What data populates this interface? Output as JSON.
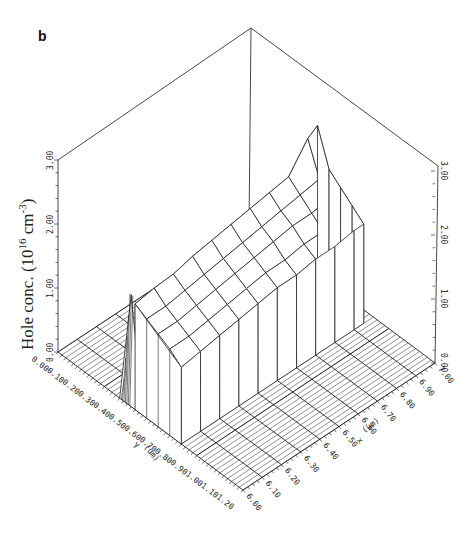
{
  "panel_label": "b",
  "chart_data": {
    "type": "surface3d",
    "title": "",
    "panel": "b",
    "zlabel": "Hole conc. (10^16 cm^-3)",
    "zlabel_parts": {
      "main": "Hole conc. (10",
      "sup1": "16",
      "mid": " cm",
      "sup2": "-3",
      "end": ")"
    },
    "xlabel": "x (um)",
    "ylabel": "y (um)",
    "x_ticks": [
      "6.00",
      "6.10",
      "6.20",
      "6.30",
      "6.40",
      "6.50",
      "6.60",
      "6.70",
      "6.80",
      "6.90",
      "7.00"
    ],
    "y_ticks": [
      "0.00",
      "0.10",
      "0.20",
      "0.30",
      "0.40",
      "0.50",
      "0.60",
      "0.70",
      "0.80",
      "0.90",
      "1.00",
      "1.10",
      "1.20"
    ],
    "z_ticks_left": [
      "0.00",
      "1.00",
      "2.00",
      "3.00"
    ],
    "z_ticks_right": [
      "0.00",
      "1.00",
      "2.00",
      "3.00"
    ],
    "xlim": [
      6.0,
      7.0
    ],
    "ylim": [
      0.0,
      1.2
    ],
    "zlim": [
      0.0,
      3.0
    ],
    "grid": false,
    "legend": null,
    "x": [
      6.0,
      6.1,
      6.2,
      6.3,
      6.4,
      6.5,
      6.6,
      6.7,
      6.8,
      6.9,
      6.95
    ],
    "y": [
      0.5,
      0.575,
      0.65,
      0.725,
      0.8
    ],
    "z_rows_note": "Hole concentration plateau between y=0.50 and y=0.80 um; zero elsewhere",
    "z": [
      [
        1.65,
        1.7,
        1.72,
        1.8,
        1.85,
        1.9,
        1.95,
        2.0,
        2.05,
        2.45,
        2.55
      ],
      [
        1.55,
        1.55,
        1.6,
        1.65,
        1.7,
        1.75,
        1.8,
        1.85,
        1.9,
        1.95,
        2.0
      ],
      [
        1.45,
        1.45,
        1.5,
        1.55,
        1.6,
        1.65,
        1.7,
        1.75,
        1.75,
        1.8,
        1.85
      ],
      [
        1.35,
        1.35,
        1.4,
        1.45,
        1.5,
        1.55,
        1.55,
        1.6,
        1.6,
        1.65,
        1.7
      ],
      [
        1.2,
        1.25,
        1.3,
        1.35,
        1.4,
        1.45,
        1.45,
        1.5,
        1.5,
        1.55,
        1.55
      ]
    ],
    "spike": {
      "x": 6.0,
      "y_range": [
        0.4,
        0.55
      ],
      "z_peak": 1.75,
      "note": "narrow spike at left edge near y=0.45"
    }
  }
}
